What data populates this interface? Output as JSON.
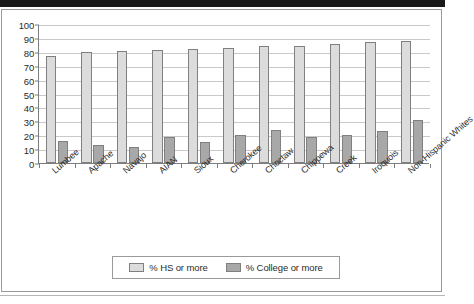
{
  "chart_data": {
    "type": "bar",
    "title": "",
    "subtitle": "",
    "xlabel": "",
    "ylabel": "",
    "ylim": [
      0,
      100
    ],
    "ytick_step": 10,
    "yticks": [
      "100",
      "90",
      "80",
      "70",
      "60",
      "50",
      "40",
      "30",
      "20",
      "10",
      "0"
    ],
    "grid": true,
    "legend_position": "bottom",
    "categories": [
      "Lumbee",
      "Apache",
      "Navajo",
      "AIAN",
      "Sioux",
      "Cherokee",
      "Choctaw",
      "Chippewa",
      "Creek",
      "Iroquois",
      "Non-Hispanic Whites"
    ],
    "series": [
      {
        "name": "% HS or more",
        "color": "#dcdcdc",
        "values": [
          77,
          80,
          80.5,
          81.5,
          82,
          83,
          84,
          84,
          85.5,
          87,
          88
        ]
      },
      {
        "name": "% College or more",
        "color": "#a8a8a8",
        "values": [
          16,
          13,
          11.5,
          19,
          15,
          20,
          24,
          18.5,
          20.5,
          23,
          31
        ]
      }
    ]
  },
  "legend": {
    "items": [
      {
        "label": "% HS or more",
        "swatch": "hs"
      },
      {
        "label": "% College or more",
        "swatch": "college"
      }
    ]
  },
  "colors": {
    "hs_bar": "#dcdcdc",
    "college_bar": "#a8a8a8",
    "bar_outline": "#808080",
    "gridline": "#c9c9c9",
    "axis": "#7d7d7d",
    "frame": "#9a9a9a",
    "text": "#2b2b2b"
  }
}
